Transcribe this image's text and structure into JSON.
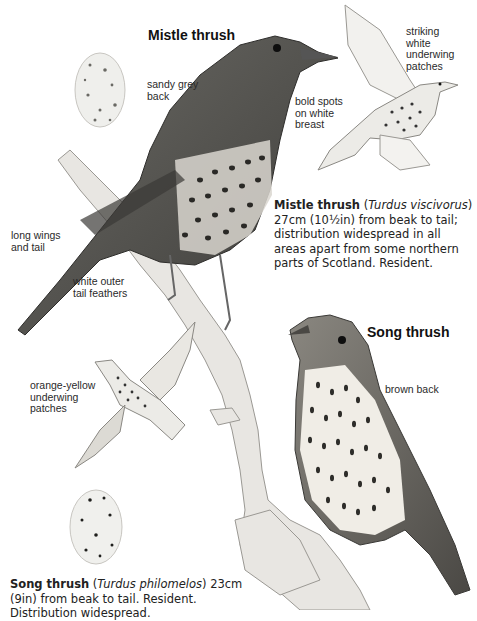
{
  "mistle_thrush": {
    "title": "Mistle thrush",
    "labels": {
      "sandy_grey_back": [
        "sandy grey",
        "back"
      ],
      "bold_spots": [
        "bold spots",
        "on white",
        "breast"
      ],
      "underwing": [
        "striking",
        "white",
        "underwing",
        "patches"
      ],
      "long_wings": [
        "long wings",
        "and tail"
      ],
      "outer_tail": [
        "white outer",
        "tail feathers"
      ]
    },
    "description": {
      "name": "Mistle thrush",
      "latin_open": " (",
      "latin": "Turdus viscivorus",
      "rest": ") 27cm (10½in) from beak to tail; distribution widespread in all areas apart from some northern parts of Scotland. Resident."
    }
  },
  "song_thrush": {
    "title": "Song thrush",
    "labels": {
      "brown_back": [
        "brown back"
      ],
      "underwing": [
        "orange-yellow",
        "underwing",
        "patches"
      ]
    },
    "description": {
      "name": "Song thrush",
      "latin_open": " (",
      "latin": "Turdus philomelos",
      "rest": ") 23cm (9in) from beak to tail. Resident. Distribution widespread."
    }
  },
  "colors": {
    "ink": "#1a1a1a",
    "plumage_dark": "#4a4a46",
    "plumage_mid": "#7a7872",
    "breast": "#efece6",
    "branch": "#e2e0dc"
  }
}
